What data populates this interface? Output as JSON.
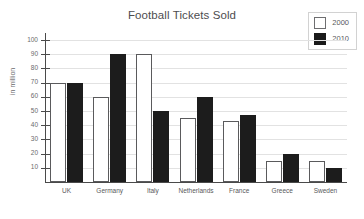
{
  "chart_data": {
    "type": "bar",
    "title": "Football Tickets Sold",
    "xlabel": "",
    "ylabel": "in million",
    "ylim": [
      0,
      105
    ],
    "ytick_step": 10,
    "yticks": [
      10,
      20,
      30,
      40,
      50,
      60,
      70,
      80,
      90,
      100
    ],
    "grid": true,
    "legend_position": "top-right",
    "categories": [
      "UK",
      "Germany",
      "Italy",
      "Netherlands",
      "France",
      "Greece",
      "Sweden"
    ],
    "series": [
      {
        "name": "2000",
        "color": "#ffffff",
        "values": [
          70,
          60,
          90,
          45,
          43,
          15,
          15
        ]
      },
      {
        "name": "2010",
        "color": "#1c1c1c",
        "values": [
          70,
          90,
          50,
          60,
          47,
          20,
          10
        ]
      }
    ]
  },
  "legend": {
    "items": [
      {
        "label": "2000",
        "style": "open"
      },
      {
        "label": "2010",
        "style": "filled"
      }
    ]
  }
}
